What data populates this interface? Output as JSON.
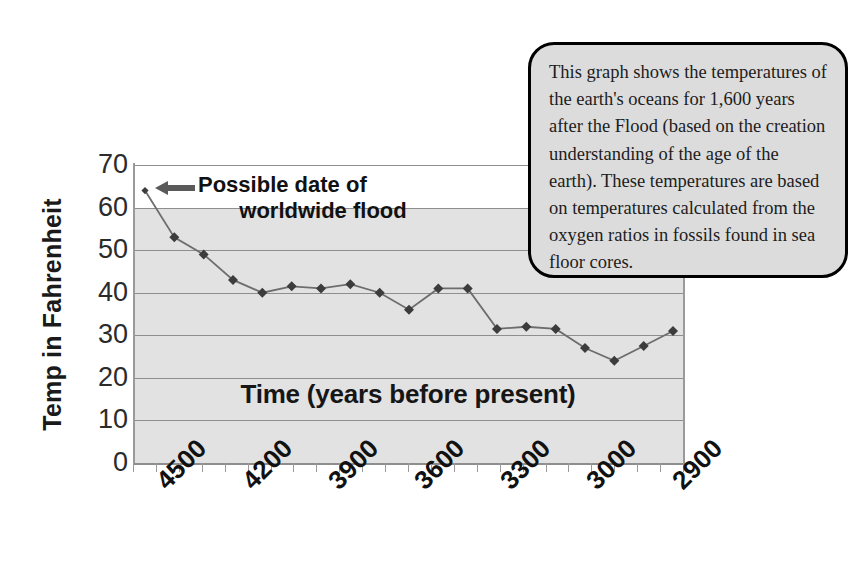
{
  "chart_data": {
    "type": "line",
    "title": "",
    "xlabel": "Time (years before present)",
    "ylabel": "Temp in Fahrenheit",
    "ylim": [
      0,
      70
    ],
    "ytick_labels": [
      "70",
      "60",
      "50",
      "40",
      "30",
      "20",
      "10",
      "0"
    ],
    "ytick_values": [
      70,
      60,
      50,
      40,
      30,
      20,
      10,
      0
    ],
    "xtick_labels": [
      "4500",
      "4200",
      "3900",
      "3600",
      "3300",
      "3000",
      "2900"
    ],
    "grid": true,
    "legend": "none",
    "marker": "diamond",
    "series": [
      {
        "name": "Ocean temperature",
        "x": [
          4500,
          4400,
          4300,
          4200,
          4100,
          4000,
          3900,
          3800,
          3700,
          3600,
          3500,
          3400,
          3300,
          3200,
          3150,
          3100,
          3050,
          2980,
          2900
        ],
        "values": [
          64,
          53,
          49,
          43,
          40,
          41.5,
          41,
          42,
          40,
          36,
          41,
          41,
          31.5,
          32,
          31.5,
          27,
          24,
          27.5,
          31
        ]
      }
    ],
    "annotations": [
      {
        "name": "flood-marker",
        "text": "Possible date of worldwide flood",
        "line1": "Possible date of",
        "line2": "worldwide flood",
        "points_to": 4500
      }
    ]
  },
  "axes": {
    "y_title": "Temp in Fahrenheit",
    "x_title": "Time (years before present)",
    "y_ticks": [
      "70",
      "60",
      "50",
      "40",
      "30",
      "20",
      "10",
      "0"
    ],
    "x_ticks": [
      "4500",
      "4200",
      "3900",
      "3600",
      "3300",
      "3000",
      "2900"
    ]
  },
  "annotation": {
    "line1": "Possible date of",
    "line2": "worldwide flood",
    "arrow_icon": "left-arrow-icon"
  },
  "callout": {
    "text": "This graph shows the temperatures of the earth's oceans for 1,600 years after the Flood (based on the creation understanding of the age of the earth). These temperatures are based on temperatures calculated from the oxygen ratios in fossils found in sea floor cores."
  },
  "colors": {
    "plot_background": "#e2e2e2",
    "gridline": "#8e8e8e",
    "series_line": "#6d6d6d",
    "marker": "#3c3c3c",
    "callout_background": "#dcdcdc",
    "callout_border": "#000000",
    "text": "#111111"
  }
}
